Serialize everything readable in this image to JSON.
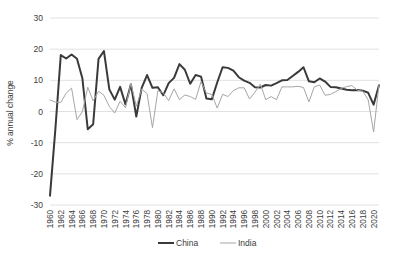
{
  "chart_data": {
    "type": "line",
    "title": "",
    "xlabel": "",
    "ylabel": "% annual change",
    "ylim": [
      -30,
      30
    ],
    "ytick_values": [
      30,
      20,
      10,
      0,
      -10,
      -20,
      -30
    ],
    "ytick_labels": [
      "30",
      "20",
      "10",
      "0",
      "-10",
      "-20",
      "-30"
    ],
    "grid": true,
    "legend_position": "bottom",
    "x": [
      1960,
      1961,
      1962,
      1963,
      1964,
      1965,
      1966,
      1967,
      1968,
      1969,
      1970,
      1971,
      1972,
      1973,
      1974,
      1975,
      1976,
      1977,
      1978,
      1979,
      1980,
      1981,
      1982,
      1983,
      1984,
      1985,
      1986,
      1987,
      1988,
      1989,
      1990,
      1991,
      1992,
      1993,
      1994,
      1995,
      1996,
      1997,
      1998,
      1999,
      2000,
      2001,
      2002,
      2003,
      2004,
      2005,
      2006,
      2007,
      2008,
      2009,
      2010,
      2011,
      2012,
      2013,
      2014,
      2015,
      2016,
      2017,
      2018,
      2019,
      2020,
      2021
    ],
    "xtick_labels": [
      "1960",
      "1962",
      "1964",
      "1966",
      "1968",
      "1970",
      "1972",
      "1974",
      "1976",
      "1978",
      "1980",
      "1982",
      "1984",
      "1986",
      "1988",
      "1990",
      "1992",
      "1994",
      "1996",
      "1998",
      "2000",
      "2002",
      "2004",
      "2006",
      "2008",
      "2010",
      "2012",
      "2014",
      "2016",
      "2018",
      "2020"
    ],
    "series": [
      {
        "name": "China",
        "color": "#3a3a3a",
        "width": 2.0,
        "values": [
          -27.0,
          -5.6,
          18.1,
          17.0,
          18.3,
          16.9,
          10.7,
          -5.7,
          -4.1,
          16.9,
          19.4,
          7.1,
          3.8,
          7.9,
          2.3,
          8.7,
          -1.6,
          7.6,
          11.7,
          7.6,
          7.8,
          5.2,
          9.1,
          10.8,
          15.2,
          13.4,
          8.9,
          11.7,
          11.2,
          4.2,
          3.9,
          9.3,
          14.2,
          14.0,
          13.1,
          11.0,
          9.9,
          9.2,
          7.8,
          7.7,
          8.5,
          8.3,
          9.1,
          10.0,
          10.1,
          11.4,
          12.7,
          14.2,
          9.7,
          9.4,
          10.6,
          9.6,
          7.9,
          7.8,
          7.4,
          7.0,
          6.8,
          6.9,
          6.7,
          6.0,
          2.2,
          8.4
        ]
      },
      {
        "name": "India",
        "color": "#a6a6a6",
        "width": 1.0,
        "values": [
          3.7,
          3.0,
          2.9,
          5.9,
          7.5,
          -2.6,
          -0.1,
          7.8,
          3.4,
          6.5,
          5.2,
          1.6,
          -0.5,
          3.3,
          1.2,
          9.1,
          1.7,
          7.2,
          5.7,
          -5.2,
          6.7,
          6.0,
          3.5,
          7.3,
          3.8,
          5.3,
          4.8,
          3.9,
          9.6,
          5.9,
          5.5,
          1.1,
          5.5,
          4.8,
          6.7,
          7.6,
          7.6,
          4.0,
          6.2,
          8.8,
          3.8,
          4.8,
          3.8,
          7.9,
          7.9,
          7.9,
          8.1,
          7.7,
          3.1,
          7.9,
          8.5,
          5.2,
          5.5,
          6.4,
          7.4,
          8.0,
          8.3,
          6.8,
          6.5,
          3.7,
          -6.6,
          8.7
        ]
      }
    ]
  },
  "legend": {
    "items": [
      {
        "label": "China"
      },
      {
        "label": "India"
      }
    ]
  }
}
